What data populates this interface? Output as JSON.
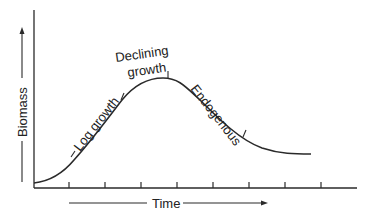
{
  "diagram": {
    "x_axis_label": "Time",
    "y_axis_label": "Biomass",
    "phases": [
      {
        "label": "Log growth"
      },
      {
        "label_line1": "Declining",
        "label_line2": "growth"
      },
      {
        "label": "Endogenous"
      }
    ],
    "colors": {
      "stroke": "#2a2a2a",
      "text": "#222222",
      "background": "#ffffff"
    }
  }
}
